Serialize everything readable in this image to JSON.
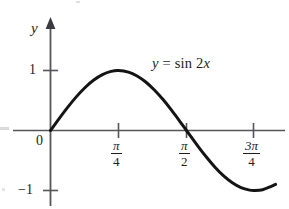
{
  "figure": {
    "background_color": "#ffffff",
    "ink_color": "#1d1d1d",
    "curve_color": "#141414",
    "axis_color": "#55555a"
  },
  "labels": {
    "y_axis": "y",
    "origin": "0",
    "y_tick_pos_one": "1",
    "y_tick_neg_one": "−1",
    "equation_y": "y",
    "equation_equals": "=",
    "equation_rhs": "sin 2",
    "equation_var": "x"
  },
  "x_ticks": [
    {
      "name": "pi-over-4",
      "numerator": "π",
      "denominator": "4",
      "value": 0.7853981634
    },
    {
      "name": "pi-over-2",
      "numerator": "π",
      "denominator": "2",
      "value": 1.5707963268
    },
    {
      "name": "3pi-over-4",
      "numerator": "3π",
      "denominator": "4",
      "value": 2.3561944902
    }
  ],
  "chart_data": {
    "type": "line",
    "title": "",
    "subtitle": "",
    "xlabel": "",
    "ylabel": "y",
    "annotations": [
      {
        "text": "y = sin 2x",
        "x": 1.55,
        "y": 0.95
      }
    ],
    "grid": false,
    "legend": false,
    "legend_position": "none",
    "xlim": [
      -0.12,
      2.95
    ],
    "ylim": [
      -1.35,
      1.55
    ],
    "xtick_values": [
      0.7853981634,
      1.5707963268,
      2.3561944902
    ],
    "xtick_labels": [
      "π/4",
      "π/2",
      "3π/4"
    ],
    "ytick_values": [
      -1,
      1
    ],
    "ytick_labels": [
      "−1",
      "1"
    ],
    "series": [
      {
        "name": "y = sin 2x",
        "formula": "sin(2x)",
        "color": "#141414",
        "linewidth": 3,
        "x_start": 0.0,
        "x_end": 2.6,
        "points": [
          {
            "x": 0.0,
            "y": 0.0
          },
          {
            "x": 0.1,
            "y": 0.1987
          },
          {
            "x": 0.2,
            "y": 0.3894
          },
          {
            "x": 0.3,
            "y": 0.5646
          },
          {
            "x": 0.4,
            "y": 0.7174
          },
          {
            "x": 0.5,
            "y": 0.8415
          },
          {
            "x": 0.6,
            "y": 0.932
          },
          {
            "x": 0.7,
            "y": 0.9854
          },
          {
            "x": 0.7854,
            "y": 1.0
          },
          {
            "x": 0.9,
            "y": 0.9738
          },
          {
            "x": 1.0,
            "y": 0.9093
          },
          {
            "x": 1.1,
            "y": 0.8085
          },
          {
            "x": 1.2,
            "y": 0.6755
          },
          {
            "x": 1.3,
            "y": 0.5155
          },
          {
            "x": 1.4,
            "y": 0.335
          },
          {
            "x": 1.5,
            "y": 0.1411
          },
          {
            "x": 1.5708,
            "y": 0.0
          },
          {
            "x": 1.7,
            "y": -0.2555
          },
          {
            "x": 1.8,
            "y": -0.4425
          },
          {
            "x": 1.9,
            "y": -0.6119
          },
          {
            "x": 2.0,
            "y": -0.7568
          },
          {
            "x": 2.1,
            "y": -0.8716
          },
          {
            "x": 2.2,
            "y": -0.9516
          },
          {
            "x": 2.3,
            "y": -0.9937
          },
          {
            "x": 2.3562,
            "y": -1.0
          },
          {
            "x": 2.45,
            "y": -0.9861
          },
          {
            "x": 2.55,
            "y": -0.932
          },
          {
            "x": 2.6,
            "y": -0.8969
          }
        ]
      }
    ]
  }
}
